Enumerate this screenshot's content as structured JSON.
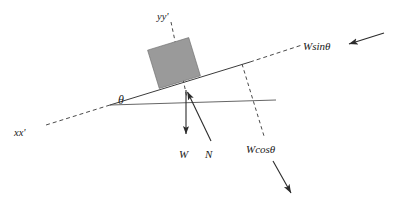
{
  "figure": {
    "background_color": "#ffffff",
    "width": 395,
    "height": 207
  },
  "labels": {
    "axis_x": "xx'",
    "axis_y": "yy'",
    "angle": "θ",
    "weight": "W",
    "normal": "N",
    "weight_parallel": "Wsinθ",
    "weight_perpendicular": "Wcosθ"
  },
  "colors": {
    "block_fill": "#9a9a9a",
    "block_stroke": "#6f6f6f",
    "line": "#3b3b3b",
    "thin_line": "#555555",
    "dashed": "#4a4a4a",
    "vector": "#2b2b2b",
    "text": "#1a1a1a"
  },
  "geometry": {
    "incline_solid": {
      "x1": 110,
      "y1": 105,
      "x2": 250,
      "y2": 62
    },
    "incline_dashed_upper": {
      "x1": 250,
      "y1": 62,
      "x2": 300,
      "y2": 46
    },
    "incline_dashed_lower": {
      "x1": 110,
      "y1": 105,
      "x2": 46,
      "y2": 125
    },
    "horizontal_ref": {
      "x1": 110,
      "y1": 105,
      "x2": 276,
      "y2": 100
    },
    "axis_y_dashed": {
      "x1": 171,
      "y1": 22,
      "x2": 187,
      "y2": 98
    },
    "perp_dashed": {
      "x1": 242,
      "y1": 64,
      "x2": 264,
      "y2": 136
    },
    "weight_vector": {
      "x1": 186,
      "y1": 90,
      "x2": 186,
      "y2": 136
    },
    "normal_vector": {
      "x1": 211,
      "y1": 141,
      "x2": 186,
      "y2": 89
    },
    "arrow_wsin": {
      "x1": 384,
      "y1": 33,
      "x2": 346,
      "y2": 45
    },
    "arrow_wcos": {
      "x1": 273,
      "y1": 161,
      "x2": 293,
      "y2": 196
    },
    "block": {
      "cx": 174,
      "cy": 63,
      "width": 43,
      "height": 40,
      "rotation_deg": -17
    }
  },
  "label_positions": {
    "axis_x": {
      "x": 14,
      "y": 136
    },
    "axis_y": {
      "x": 157,
      "y": 20
    },
    "angle": {
      "x": 118,
      "y": 104
    },
    "weight": {
      "x": 179,
      "y": 158
    },
    "normal": {
      "x": 205,
      "y": 158
    },
    "weight_parallel": {
      "x": 303,
      "y": 50
    },
    "weight_perpendicular": {
      "x": 246,
      "y": 153
    }
  }
}
